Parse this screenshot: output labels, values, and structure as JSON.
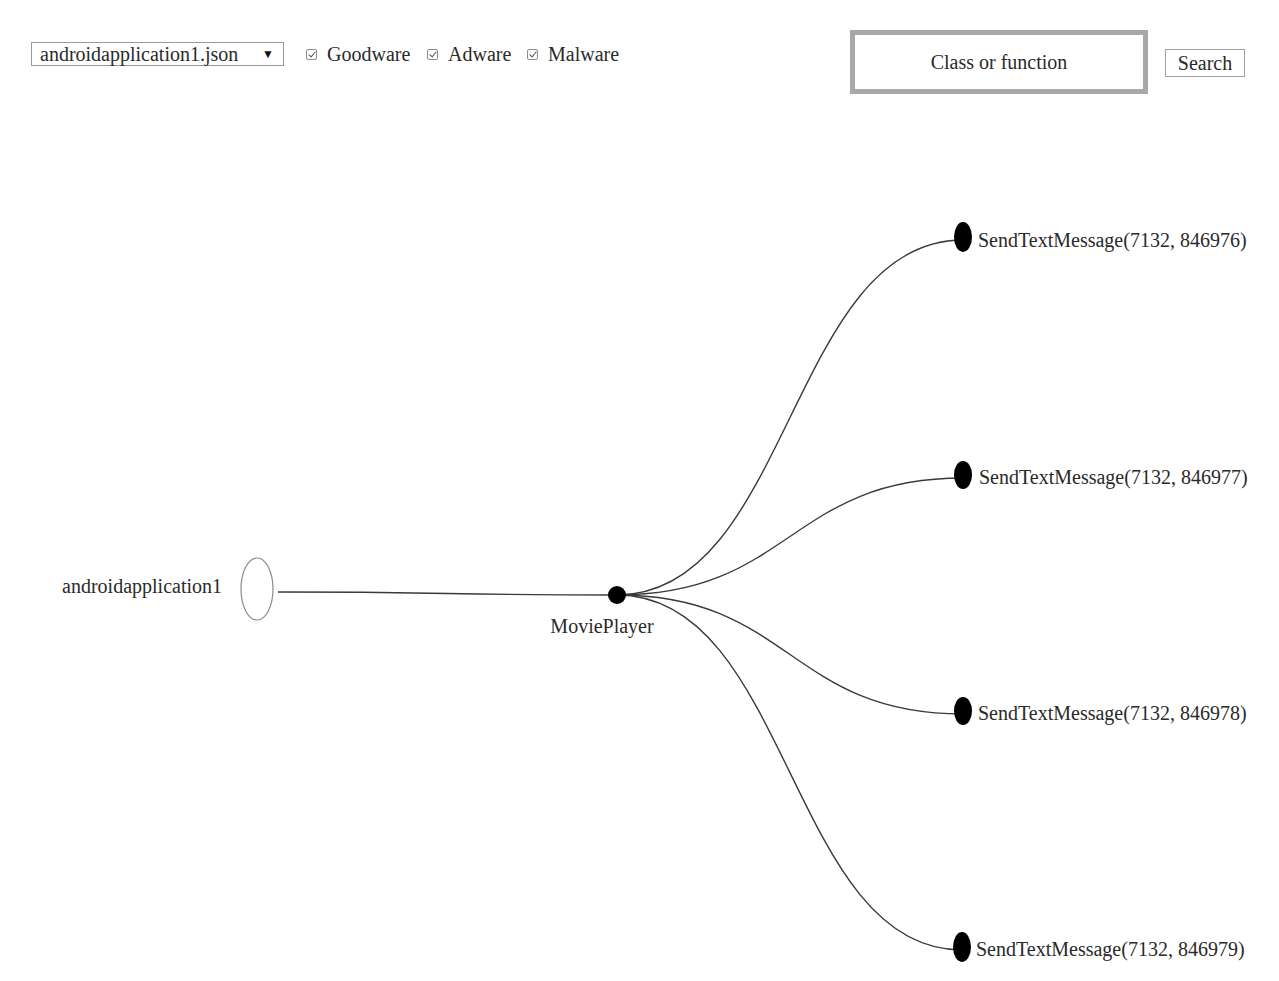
{
  "toolbar": {
    "file_select": {
      "selected": "androidapplication1.json",
      "arrow_icon": "▼"
    },
    "filters": [
      {
        "label": "Goodware",
        "checked": true
      },
      {
        "label": "Adware",
        "checked": true
      },
      {
        "label": "Malware",
        "checked": true
      }
    ],
    "search": {
      "placeholder": "Class or function",
      "value": "",
      "button_label": "Search"
    }
  },
  "tree": {
    "root": {
      "label": "androidapplication1",
      "shape": "hollow-ellipse"
    },
    "class_node": {
      "label": "MoviePlayer",
      "shape": "filled-circle"
    },
    "leaves": [
      {
        "label": "SendTextMessage(7132, 846976)"
      },
      {
        "label": "SendTextMessage(7132, 846977)"
      },
      {
        "label": "SendTextMessage(7132, 846978)"
      },
      {
        "label": "SendTextMessage(7132, 846979)"
      }
    ],
    "colors": {
      "node_fill": "#000000",
      "link_stroke": "#3a3a3a",
      "root_stroke": "#8a8a8a"
    }
  }
}
